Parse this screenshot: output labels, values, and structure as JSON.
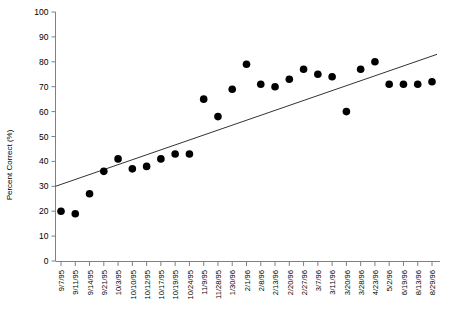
{
  "chart_data": {
    "type": "scatter",
    "title": "",
    "xlabel": "",
    "ylabel": "Percent Correct (%)",
    "ylim": [
      0,
      100
    ],
    "ytick_step": 10,
    "yticks": [
      0,
      10,
      20,
      30,
      40,
      50,
      60,
      70,
      80,
      90,
      100
    ],
    "grid": false,
    "legend": "none",
    "categories": [
      "9/7/95",
      "9/11/95",
      "9/14/95",
      "9/21/95",
      "10/3/95",
      "10/10/95",
      "10/12/95",
      "10/17/95",
      "10/19/95",
      "10/24/95",
      "11/9/95",
      "11/28/95",
      "1/30/96",
      "2/1/96",
      "2/8/96",
      "2/13/96",
      "2/20/96",
      "2/27/96",
      "3/7/96",
      "3/11/96",
      "3/20/96",
      "3/28/96",
      "4/23/96",
      "5/2/96",
      "6/19/96",
      "8/13/96",
      "8/29/96"
    ],
    "values": [
      20,
      19,
      27,
      36,
      41,
      37,
      38,
      41,
      43,
      43,
      65,
      58,
      69,
      79,
      71,
      70,
      73,
      77,
      75,
      74,
      60,
      77,
      80,
      71,
      71,
      71,
      72
    ],
    "series": [
      {
        "name": "Percent Correct",
        "values": [
          20,
          19,
          27,
          36,
          41,
          37,
          38,
          41,
          43,
          43,
          65,
          58,
          69,
          79,
          71,
          70,
          73,
          77,
          75,
          74,
          60,
          77,
          80,
          71,
          71,
          71,
          72
        ]
      }
    ],
    "trendline": {
      "type": "linear",
      "start": {
        "x_index": 0,
        "y": 30
      },
      "end": {
        "x_index": 26,
        "y": 83
      }
    },
    "marker": {
      "shape": "circle",
      "color": "#000000",
      "size": 5
    },
    "axis_color": "#808080",
    "trendline_color": "#333333"
  }
}
